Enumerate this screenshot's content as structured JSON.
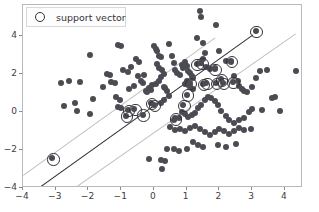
{
  "legend": {
    "position": "upper-left",
    "marker_icon": "open-circle-marker",
    "label": "support vector"
  },
  "footer": {
    "text": ""
  },
  "chart_data": {
    "type": "scatter",
    "title": "",
    "xlabel": "",
    "ylabel": "",
    "xlim": [
      -4.0,
      4.55
    ],
    "ylim": [
      -4.0,
      5.6
    ],
    "grid": false,
    "xticks": [
      -4,
      -3,
      -2,
      -1,
      0,
      1,
      2,
      3,
      4
    ],
    "xticklabels": [
      "-4",
      "-3",
      "-2",
      "-1",
      "0",
      "1",
      "2",
      "3",
      "4"
    ],
    "yticks": [
      -4,
      -2,
      0,
      2,
      4
    ],
    "yticklabels": [
      "-4",
      "-2",
      "0",
      "2",
      "4"
    ],
    "legend_entries": [
      "support vector"
    ],
    "marker_color": "#4b4b53",
    "support_vector_ring_color": "#33333a",
    "decision_boundary_color": "#2e2e33",
    "margin_line_color": "#bfbfc4",
    "lines": [
      {
        "name": "decision-boundary",
        "style": "solid",
        "color": "#2e2e33",
        "x": [
          -3.55,
          3.0
        ],
        "y": [
          -4.0,
          4.05
        ]
      },
      {
        "name": "upper-margin",
        "style": "solid",
        "color": "#bfbfc4",
        "x": [
          -4.0,
          1.85
        ],
        "y": [
          -3.3,
          3.9
        ]
      },
      {
        "name": "lower-margin",
        "style": "solid",
        "color": "#bfbfc4",
        "x": [
          -2.45,
          4.3
        ],
        "y": [
          -4.0,
          4.1
        ]
      }
    ],
    "series": [
      {
        "name": "samples",
        "marker": "filled-circle",
        "color": "#4b4b53",
        "points": [
          [
            -2.85,
            1.5
          ],
          [
            -2.6,
            1.6
          ],
          [
            -2.25,
            1.55
          ],
          [
            -2.75,
            0.3
          ],
          [
            -2.4,
            0.45
          ],
          [
            -2.35,
            0.05
          ],
          [
            -1.95,
            3.0
          ],
          [
            -1.85,
            0.65
          ],
          [
            -1.95,
            -0.1
          ],
          [
            -1.55,
            1.3
          ],
          [
            -1.45,
            2.0
          ],
          [
            -1.35,
            1.95
          ],
          [
            -1.3,
            1.55
          ],
          [
            -1.2,
            1.5
          ],
          [
            -1.1,
            3.5
          ],
          [
            -1.0,
            3.45
          ],
          [
            -1.15,
            0.75
          ],
          [
            -1.05,
            0.6
          ],
          [
            -1.1,
            0.25
          ],
          [
            -1.0,
            0.2
          ],
          [
            -0.95,
            2.2
          ],
          [
            -0.8,
            2.1
          ],
          [
            -0.7,
            2.35
          ],
          [
            -0.75,
            1.2
          ],
          [
            -0.6,
            1.35
          ],
          [
            -0.55,
            2.75
          ],
          [
            -0.45,
            2.6
          ],
          [
            -0.5,
            1.85
          ],
          [
            -0.4,
            1.6
          ],
          [
            -0.35,
            1.5
          ],
          [
            -0.3,
            1.95
          ],
          [
            -0.25,
            1.1
          ],
          [
            -0.2,
            1.05
          ],
          [
            -0.15,
            1.25
          ],
          [
            -0.1,
            1.15
          ],
          [
            -0.05,
            1.4
          ],
          [
            0.0,
            3.45
          ],
          [
            0.05,
            3.3
          ],
          [
            0.1,
            3.2
          ],
          [
            0.15,
            2.95
          ],
          [
            0.2,
            2.85
          ],
          [
            0.1,
            2.5
          ],
          [
            0.15,
            2.3
          ],
          [
            0.25,
            2.2
          ],
          [
            0.3,
            2.0
          ],
          [
            0.2,
            1.8
          ],
          [
            0.15,
            1.6
          ],
          [
            0.05,
            1.45
          ],
          [
            0.3,
            1.3
          ],
          [
            0.35,
            1.25
          ],
          [
            0.4,
            1.1
          ],
          [
            0.45,
            0.85
          ],
          [
            0.3,
            0.6
          ],
          [
            0.2,
            0.45
          ],
          [
            0.45,
            3.55
          ],
          [
            0.55,
            2.95
          ],
          [
            0.6,
            2.55
          ],
          [
            0.65,
            2.2
          ],
          [
            0.7,
            2.05
          ],
          [
            0.8,
            1.95
          ],
          [
            0.85,
            2.45
          ],
          [
            0.9,
            2.3
          ],
          [
            0.95,
            2.6
          ],
          [
            1.0,
            2.4
          ],
          [
            1.05,
            2.15
          ],
          [
            1.1,
            2.05
          ],
          [
            1.15,
            1.85
          ],
          [
            1.2,
            1.75
          ],
          [
            1.0,
            1.6
          ],
          [
            0.95,
            1.45
          ],
          [
            1.1,
            1.35
          ],
          [
            1.2,
            1.2
          ],
          [
            1.3,
            3.85
          ],
          [
            1.4,
            5.3
          ],
          [
            1.45,
            4.95
          ],
          [
            1.5,
            3.6
          ],
          [
            1.55,
            3.1
          ],
          [
            1.5,
            2.75
          ],
          [
            1.45,
            2.55
          ],
          [
            1.6,
            2.35
          ],
          [
            1.7,
            2.25
          ],
          [
            1.85,
            2.3
          ],
          [
            1.9,
            4.55
          ],
          [
            2.0,
            3.2
          ],
          [
            2.2,
            2.65
          ],
          [
            2.35,
            2.6
          ],
          [
            2.45,
            1.85
          ],
          [
            2.55,
            1.6
          ],
          [
            2.6,
            1.35
          ],
          [
            2.7,
            1.2
          ],
          [
            2.75,
            1.1
          ],
          [
            2.85,
            1.05
          ],
          [
            3.0,
            1.3
          ],
          [
            3.1,
            1.75
          ],
          [
            3.25,
            2.15
          ],
          [
            3.45,
            2.2
          ],
          [
            3.6,
            0.7
          ],
          [
            3.7,
            0.75
          ],
          [
            3.85,
            0.05
          ],
          [
            4.35,
            2.15
          ],
          [
            3.3,
            0.1
          ],
          [
            3.0,
            0.15
          ],
          [
            2.9,
            0.0
          ],
          [
            2.75,
            -0.35
          ],
          [
            2.6,
            -0.45
          ],
          [
            2.45,
            -0.6
          ],
          [
            2.3,
            -0.45
          ],
          [
            2.2,
            -0.2
          ],
          [
            2.05,
            0.05
          ],
          [
            1.95,
            0.35
          ],
          [
            1.85,
            0.55
          ],
          [
            1.75,
            0.7
          ],
          [
            1.65,
            0.75
          ],
          [
            1.55,
            0.6
          ],
          [
            1.45,
            0.35
          ],
          [
            1.35,
            0.2
          ],
          [
            1.25,
            -0.05
          ],
          [
            1.15,
            -0.15
          ],
          [
            1.05,
            -0.25
          ],
          [
            0.95,
            -0.1
          ],
          [
            0.85,
            0.0
          ],
          [
            0.75,
            -0.35
          ],
          [
            0.6,
            -0.45
          ],
          [
            0.5,
            -0.8
          ],
          [
            0.65,
            -0.95
          ],
          [
            0.8,
            -0.9
          ],
          [
            0.95,
            -1.0
          ],
          [
            1.1,
            -0.85
          ],
          [
            1.25,
            -0.75
          ],
          [
            1.4,
            -0.9
          ],
          [
            1.55,
            -1.05
          ],
          [
            1.7,
            -1.2
          ],
          [
            1.85,
            -1.05
          ],
          [
            2.0,
            -0.9
          ],
          [
            2.15,
            -1.0
          ],
          [
            2.3,
            -1.15
          ],
          [
            2.45,
            -1.0
          ],
          [
            2.6,
            -0.85
          ],
          [
            2.75,
            -0.95
          ],
          [
            2.95,
            -0.9
          ],
          [
            1.2,
            -1.6
          ],
          [
            1.35,
            -1.75
          ],
          [
            1.5,
            -1.85
          ],
          [
            1.95,
            -1.75
          ],
          [
            2.2,
            -1.85
          ],
          [
            2.5,
            -1.7
          ],
          [
            0.6,
            -1.95
          ],
          [
            0.75,
            -2.05
          ],
          [
            0.4,
            -1.95
          ],
          [
            0.2,
            -2.55
          ],
          [
            0.35,
            -2.6
          ],
          [
            0.25,
            -3.0
          ],
          [
            -0.15,
            -2.5
          ],
          [
            1.0,
            -1.95
          ]
        ]
      },
      {
        "name": "support-vectors",
        "marker": "circled",
        "ring_color": "#33333a",
        "points": [
          [
            -3.1,
            -2.45
          ],
          [
            -0.85,
            -0.2
          ],
          [
            -0.8,
            0.1
          ],
          [
            -0.6,
            0.15
          ],
          [
            -0.35,
            -0.15
          ],
          [
            -0.1,
            0.45
          ],
          [
            0.0,
            0.35
          ],
          [
            0.65,
            -0.35
          ],
          [
            0.9,
            0.35
          ],
          [
            1.0,
            0.9
          ],
          [
            1.1,
            1.5
          ],
          [
            1.3,
            2.5
          ],
          [
            1.45,
            2.55
          ],
          [
            1.5,
            1.45
          ],
          [
            1.6,
            1.5
          ],
          [
            1.85,
            2.25
          ],
          [
            1.9,
            1.5
          ],
          [
            2.05,
            1.7
          ],
          [
            2.1,
            1.5
          ],
          [
            2.35,
            2.65
          ],
          [
            2.4,
            1.55
          ],
          [
            3.1,
            4.25
          ]
        ]
      }
    ]
  }
}
